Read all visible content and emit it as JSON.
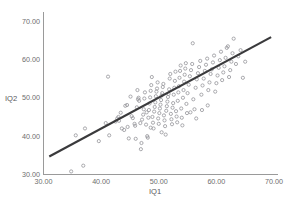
{
  "chart_data": {
    "type": "scatter",
    "title": "",
    "xlabel": "IQ1",
    "ylabel": "IQ2",
    "xlim": [
      30,
      70
    ],
    "ylim": [
      30,
      70
    ],
    "xticks": [
      "30.00",
      "40.00",
      "50.00",
      "60.00",
      "70.00"
    ],
    "yticks": [
      "30.00",
      "40.00",
      "50.00",
      "60.00",
      "70.00"
    ],
    "xtick_values": [
      30,
      40,
      50,
      60,
      70
    ],
    "ytick_values": [
      30,
      40,
      50,
      60,
      70
    ],
    "grid": false,
    "legend": "none",
    "marker_style": "open-circle",
    "marker_color": "#9b9b9f",
    "fit_line": {
      "label": "linear regression line",
      "color": "#3a3a3c",
      "x_start": 31.0,
      "y_start": 34.7,
      "x_end": 69.5,
      "y_end": 65.8
    },
    "points": [
      [
        34.8,
        30.8
      ],
      [
        36.9,
        32.3
      ],
      [
        39.6,
        38.7
      ],
      [
        37.2,
        42.0
      ],
      [
        35.6,
        40.2
      ],
      [
        41.2,
        55.5
      ],
      [
        41.4,
        40.2
      ],
      [
        42.5,
        43.8
      ],
      [
        43.0,
        45.0
      ],
      [
        43.4,
        46.1
      ],
      [
        43.1,
        44.0
      ],
      [
        44.2,
        47.9
      ],
      [
        44.5,
        48.1
      ],
      [
        44.0,
        41.6
      ],
      [
        44.6,
        42.4
      ],
      [
        45.1,
        50.3
      ],
      [
        45.3,
        45.2
      ],
      [
        45.5,
        44.7
      ],
      [
        45.8,
        43.2
      ],
      [
        45.9,
        42.7
      ],
      [
        46.0,
        39.3
      ],
      [
        46.2,
        47.5
      ],
      [
        46.4,
        49.6
      ],
      [
        46.5,
        50.0
      ],
      [
        46.6,
        49.2
      ],
      [
        46.3,
        52.0
      ],
      [
        46.8,
        43.4
      ],
      [
        46.9,
        36.6
      ],
      [
        47.0,
        38.2
      ],
      [
        47.1,
        44.3
      ],
      [
        47.3,
        45.6
      ],
      [
        47.4,
        47.0
      ],
      [
        47.5,
        49.8
      ],
      [
        47.6,
        51.4
      ],
      [
        47.8,
        43.0
      ],
      [
        47.9,
        46.2
      ],
      [
        48.0,
        40.0
      ],
      [
        48.1,
        39.6
      ],
      [
        48.2,
        44.8
      ],
      [
        48.3,
        46.8
      ],
      [
        48.4,
        48.5
      ],
      [
        48.5,
        50.1
      ],
      [
        48.6,
        51.8
      ],
      [
        48.7,
        53.3
      ],
      [
        48.8,
        55.4
      ],
      [
        48.9,
        45.0
      ],
      [
        49.0,
        43.5
      ],
      [
        49.1,
        42.0
      ],
      [
        49.2,
        46.4
      ],
      [
        49.3,
        47.6
      ],
      [
        49.4,
        48.8
      ],
      [
        49.5,
        50.4
      ],
      [
        49.6,
        51.6
      ],
      [
        49.7,
        52.4
      ],
      [
        49.8,
        54.0
      ],
      [
        49.9,
        44.6
      ],
      [
        50.0,
        43.2
      ],
      [
        50.1,
        46.0
      ],
      [
        50.2,
        47.2
      ],
      [
        50.3,
        48.2
      ],
      [
        50.4,
        49.4
      ],
      [
        50.5,
        50.6
      ],
      [
        50.6,
        51.2
      ],
      [
        50.7,
        52.8
      ],
      [
        50.8,
        53.6
      ],
      [
        50.9,
        45.4
      ],
      [
        51.0,
        44.1
      ],
      [
        51.1,
        42.6
      ],
      [
        51.2,
        40.4
      ],
      [
        51.3,
        46.6
      ],
      [
        51.4,
        47.8
      ],
      [
        51.5,
        49.0
      ],
      [
        51.6,
        50.2
      ],
      [
        51.7,
        51.0
      ],
      [
        51.8,
        52.2
      ],
      [
        51.9,
        55.0
      ],
      [
        52.0,
        56.2
      ],
      [
        52.1,
        45.8
      ],
      [
        52.2,
        44.4
      ],
      [
        52.3,
        43.1
      ],
      [
        52.4,
        47.4
      ],
      [
        52.5,
        48.6
      ],
      [
        52.6,
        50.8
      ],
      [
        52.7,
        52.6
      ],
      [
        52.8,
        54.4
      ],
      [
        52.9,
        56.8
      ],
      [
        53.0,
        46.5
      ],
      [
        53.1,
        45.1
      ],
      [
        53.2,
        43.6
      ],
      [
        53.3,
        49.2
      ],
      [
        53.4,
        51.4
      ],
      [
        53.5,
        53.0
      ],
      [
        53.6,
        55.2
      ],
      [
        53.7,
        57.0
      ],
      [
        53.8,
        58.4
      ],
      [
        53.9,
        47.2
      ],
      [
        54.0,
        44.8
      ],
      [
        54.1,
        42.8
      ],
      [
        54.2,
        50.0
      ],
      [
        54.3,
        52.0
      ],
      [
        54.4,
        54.2
      ],
      [
        54.5,
        56.0
      ],
      [
        54.6,
        57.6
      ],
      [
        54.7,
        59.0
      ],
      [
        54.8,
        48.4
      ],
      [
        54.9,
        46.0
      ],
      [
        55.0,
        51.2
      ],
      [
        55.2,
        53.4
      ],
      [
        55.4,
        55.6
      ],
      [
        55.6,
        57.2
      ],
      [
        55.8,
        58.8
      ],
      [
        55.9,
        64.2
      ],
      [
        56.0,
        49.6
      ],
      [
        56.2,
        47.0
      ],
      [
        56.4,
        52.6
      ],
      [
        56.6,
        54.8
      ],
      [
        56.8,
        56.4
      ],
      [
        57.0,
        58.0
      ],
      [
        57.2,
        59.6
      ],
      [
        57.4,
        50.8
      ],
      [
        57.6,
        53.2
      ],
      [
        57.8,
        55.0
      ],
      [
        58.0,
        57.0
      ],
      [
        58.2,
        58.6
      ],
      [
        58.4,
        60.2
      ],
      [
        58.6,
        52.0
      ],
      [
        58.8,
        54.0
      ],
      [
        59.0,
        56.2
      ],
      [
        59.2,
        57.4
      ],
      [
        59.4,
        59.2
      ],
      [
        59.6,
        61.0
      ],
      [
        59.8,
        51.6
      ],
      [
        60.0,
        53.8
      ],
      [
        60.2,
        55.8
      ],
      [
        60.4,
        57.8
      ],
      [
        60.6,
        59.8
      ],
      [
        60.8,
        62.0
      ],
      [
        61.0,
        54.6
      ],
      [
        61.2,
        56.6
      ],
      [
        61.4,
        58.2
      ],
      [
        61.6,
        60.4
      ],
      [
        61.8,
        63.0
      ],
      [
        62.0,
        63.4
      ],
      [
        62.2,
        55.4
      ],
      [
        62.4,
        57.2
      ],
      [
        62.6,
        59.4
      ],
      [
        62.8,
        61.6
      ],
      [
        63.0,
        65.4
      ],
      [
        63.4,
        58.8
      ],
      [
        63.8,
        60.8
      ],
      [
        64.2,
        62.4
      ],
      [
        64.6,
        55.2
      ],
      [
        65.0,
        59.4
      ],
      [
        55.5,
        46.2
      ],
      [
        56.5,
        44.6
      ],
      [
        57.5,
        46.8
      ],
      [
        58.5,
        48.0
      ],
      [
        50.5,
        41.0
      ],
      [
        48.6,
        42.2
      ],
      [
        44.8,
        39.4
      ],
      [
        42.8,
        44.6
      ],
      [
        43.6,
        42.0
      ],
      [
        40.8,
        43.4
      ]
    ]
  }
}
